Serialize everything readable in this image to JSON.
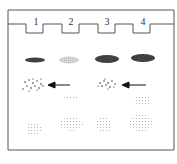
{
  "figure": {
    "type": "gel-electrophoresis-diagram",
    "lanes": [
      {
        "label": "1"
      },
      {
        "label": "2"
      },
      {
        "label": "3"
      },
      {
        "label": "4"
      }
    ],
    "band_rows": [
      {
        "row": "upper",
        "lanes": {
          "1": "dark-thin",
          "2": "light",
          "3": "dark-thick",
          "4": "dark-thick"
        }
      },
      {
        "row": "speckled",
        "lanes": {
          "1": "speckled-with-arrow",
          "3": "speckled-with-arrow"
        }
      },
      {
        "row": "faint-middle",
        "lanes": {
          "2": "faint",
          "4": "faint"
        }
      },
      {
        "row": "lower-diffuse",
        "lanes": {
          "1": "faint-diffuse",
          "2": "faint-diffuse",
          "3": "faint-diffuse",
          "4": "faint-diffuse"
        }
      }
    ],
    "arrows": [
      {
        "points_to_lane": "1",
        "row": "speckled"
      },
      {
        "points_to_lane": "3",
        "row": "speckled"
      }
    ]
  }
}
